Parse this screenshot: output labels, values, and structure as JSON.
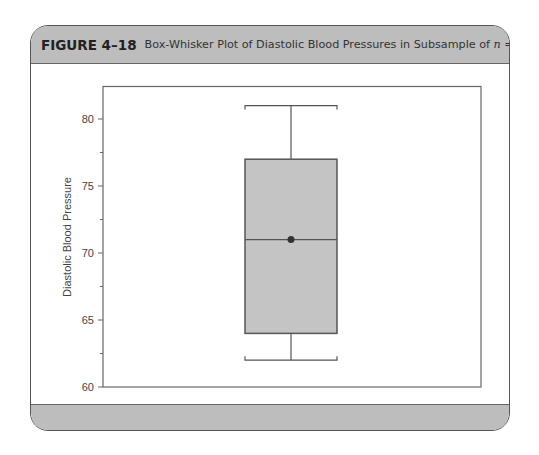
{
  "figure": {
    "label": "FIGURE 4–18",
    "title_prefix": "Box-Whisker Plot of Diastolic Blood Pressures in Subsample of ",
    "title_var": "n",
    "title_suffix": " = 10"
  },
  "chart_data": {
    "type": "box",
    "title": "Box-Whisker Plot of Diastolic Blood Pressures in Subsample of n = 10",
    "xlabel": "",
    "ylabel": "Diastolic Blood Pressure",
    "ylim": [
      60,
      82.5
    ],
    "yticks": [
      60,
      65,
      70,
      75,
      80
    ],
    "minor_yticks": [
      62.5,
      67.5,
      72.5,
      77.5
    ],
    "grid": false,
    "series": [
      {
        "name": "Diastolic Blood Pressure",
        "min": 62,
        "q1": 64,
        "median": 71,
        "q3": 77,
        "max": 81,
        "mean": 71,
        "n": 10
      }
    ],
    "colors": {
      "box_fill": "#c4c4c4",
      "line": "#555555",
      "mean_marker": "#333333"
    }
  }
}
